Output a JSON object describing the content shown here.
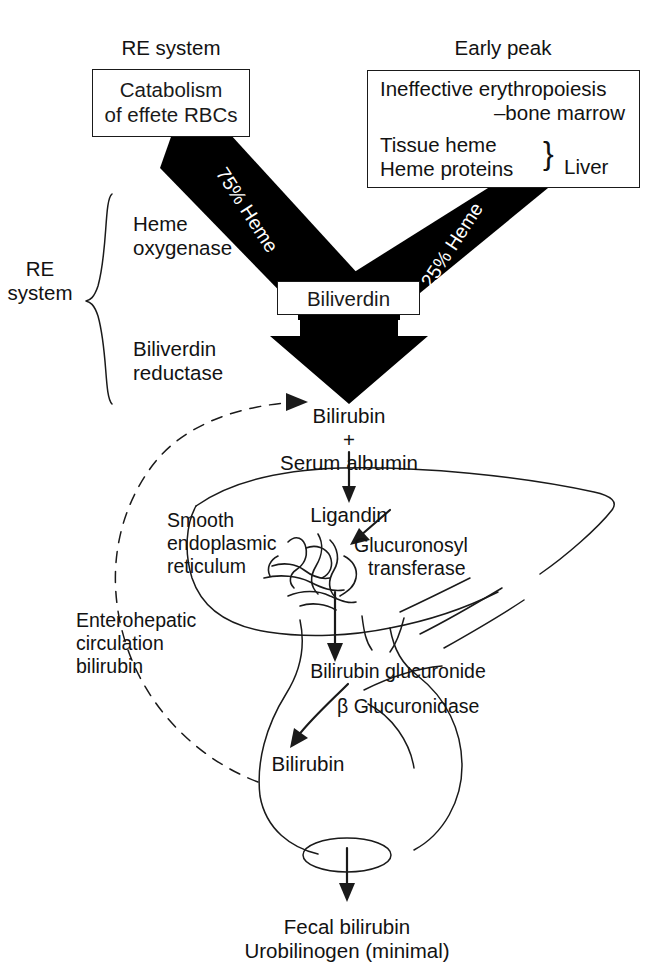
{
  "diagram": {
    "headings": {
      "left": "RE system",
      "right": "Early peak"
    },
    "source_boxes": {
      "left": {
        "line1": "Catabolism",
        "line2": "of effete RBCs"
      },
      "right": {
        "line1": "Ineffective erythropoiesis",
        "line2": "–bone marrow",
        "line3": "Tissue heme",
        "line4": "Heme proteins",
        "brace": "}",
        "brace_label": "Liver"
      }
    },
    "flux_labels": {
      "left": "75% Heme",
      "right": "25% Heme"
    },
    "enzymes": {
      "bracket_label_line1": "RE",
      "bracket_label_line2": "system",
      "enzyme1_line1": "Heme",
      "enzyme1_line2": "oxygenase",
      "enzyme2_line1": "Biliverdin",
      "enzyme2_line2": "reductase"
    },
    "nodes": {
      "biliverdin": "Biliverdin",
      "bilirubin_plasma_line1": "Bilirubin",
      "bilirubin_plasma_plus": "+",
      "bilirubin_plasma_line2": "Serum albumin",
      "ligandin": "Ligandin",
      "bilirubin_glucuronide": "Bilirubin glucuronide",
      "bilirubin_gut": "Bilirubin",
      "fecal_line1": "Fecal bilirubin",
      "fecal_line2": "Urobilinogen (minimal)"
    },
    "organelles": {
      "ser_line1": "Smooth",
      "ser_line2": "endoplasmic",
      "ser_line3": "reticulum",
      "transferase_line1": "Glucuronosyl",
      "transferase_line2": "transferase",
      "glucuronidase": "β Glucuronidase"
    },
    "circulation": {
      "line1": "Enterohepatic",
      "line2": "circulation",
      "line3": "bilirubin"
    },
    "colors": {
      "ink": "#1a1a1a",
      "fill_black": "#000000",
      "paper": "#ffffff",
      "label_on_black": "#ffffff"
    }
  }
}
